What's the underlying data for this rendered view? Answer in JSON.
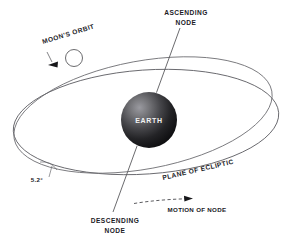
{
  "figure": {
    "background_color": "#ffffff",
    "line_color": "#5a5a5e",
    "text_color": "#1b1b1f"
  },
  "bodies": {
    "earth": {
      "label": "EARTH",
      "icon": "earth-sphere-icon",
      "center_x": 149,
      "center_y": 120,
      "radius": 28,
      "fill_light": "#8d8d92",
      "fill_dark": "#121214",
      "label_color": "#f2f2f2"
    },
    "moon": {
      "label": "",
      "icon": "moon-circle-icon",
      "center_x": 74,
      "center_y": 58,
      "radius": 8.5,
      "fill": "#ffffff",
      "stroke": "#5a5a5e"
    }
  },
  "labels": {
    "ascending_node": "ASCENDING\nNODE",
    "ascending_node_line1": "ASCENDING",
    "ascending_node_line2": "NODE",
    "descending_node_line1": "DESCENDING",
    "descending_node_line2": "NODE",
    "moons_orbit": "MOON'S ORBIT",
    "plane_of_ecliptic": "PLANE OF ECLIPTIC",
    "motion_of_node": "MOTION OF NODE",
    "inclination_angle": "5.2°"
  },
  "annotations": {
    "inclination_value": 5.2,
    "inclination_unit": "degrees",
    "node_motion_direction": "rightward",
    "moon_motion_direction": "leftward"
  }
}
